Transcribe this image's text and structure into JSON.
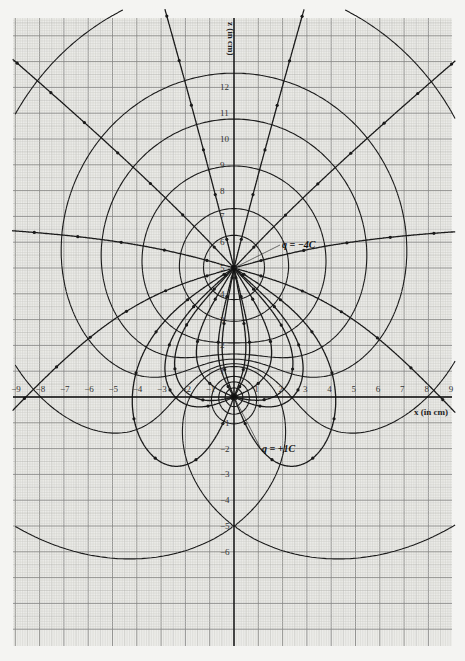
{
  "chart_data": {
    "type": "diagram",
    "xlabel": "x (in cm)",
    "ylabel": "z (in cm)",
    "xlim": [
      -9,
      9
    ],
    "ylim": [
      -8.6,
      14.9
    ],
    "x_ticks": [
      "-9",
      "-8",
      "-7",
      "-6",
      "-5",
      "-4",
      "-3",
      "-2",
      "-1",
      "1",
      "2",
      "3",
      "4",
      "5",
      "6",
      "7",
      "8",
      "9"
    ],
    "y_ticks": [
      "-6",
      "-5",
      "-4",
      "-3",
      "-2",
      "-1",
      "1",
      "2",
      "3",
      "4",
      "5",
      "6",
      "7",
      "8",
      "9",
      "10",
      "11",
      "12"
    ],
    "grid": true,
    "charges": [
      {
        "label": "q = −4C",
        "q": -4,
        "x": 0,
        "z": 5
      },
      {
        "label": "q = +1C",
        "q": 1,
        "x": 0,
        "z": 0
      }
    ]
  },
  "labels": {
    "x_axis": "x (in cm)",
    "z_axis": "z (in cm)",
    "charge_negative": "q = −4C",
    "charge_positive": "q = +1C"
  },
  "colors": {
    "paper": "#f4f4f2",
    "grid_minor": "#c9c9c6",
    "grid_major": "#8a8a88",
    "ink": "#1a1a1a"
  }
}
